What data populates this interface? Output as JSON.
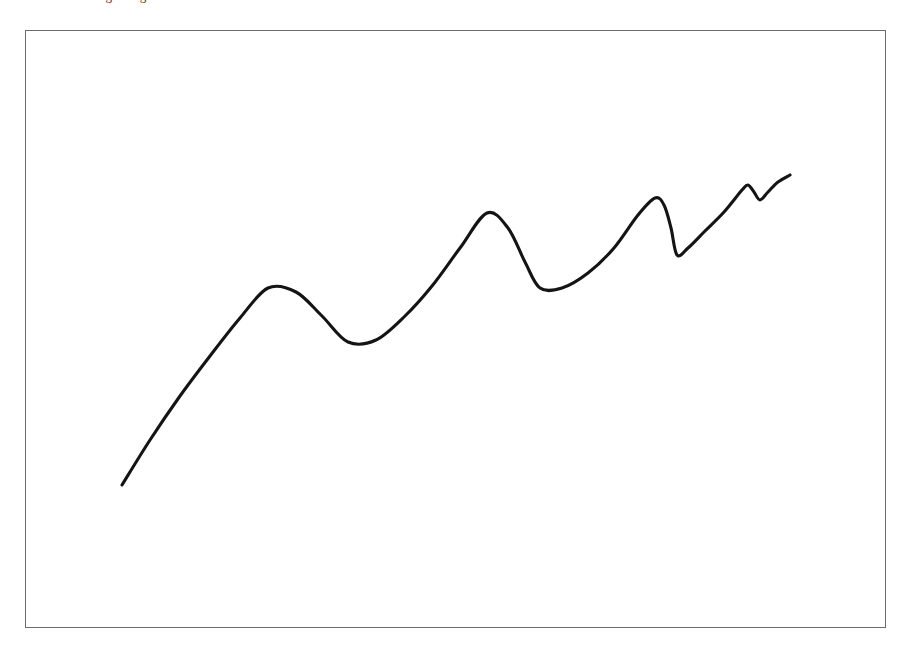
{
  "figure": {
    "caption_clipped": "a curve showing rising trend with oscillations",
    "frame": {
      "x": 25,
      "y": 30,
      "width": 861,
      "height": 598,
      "border_color": "#6b6b6b",
      "background_color": "#ffffff"
    }
  },
  "chart_data": {
    "type": "line",
    "title": "",
    "subtitle": "",
    "xlabel": "",
    "ylabel": "",
    "grid": false,
    "legend": null,
    "axes_visible": false,
    "tick_labels": [],
    "annotations": [],
    "series": [
      {
        "name": "curve",
        "color": "#141414",
        "stroke_width": 3.1,
        "description": "Single smooth hand-drawn style curve rising from lower-left to upper-right with four damped oscillations of decreasing amplitude and increasing frequency",
        "x": [
          122,
          150,
          180,
          210,
          240,
          268,
          296,
          322,
          348,
          376,
          405,
          432,
          460,
          487,
          508,
          525,
          540,
          562,
          588,
          614,
          638,
          655,
          664,
          671,
          677,
          688,
          705,
          724,
          742,
          748,
          754,
          760,
          768,
          778,
          790
        ],
        "y": [
          485,
          440,
          396,
          356,
          318,
          288,
          292,
          316,
          342,
          340,
          316,
          286,
          248,
          213,
          228,
          262,
          288,
          288,
          273,
          248,
          215,
          198,
          205,
          228,
          255,
          248,
          231,
          212,
          190,
          185,
          192,
          200,
          192,
          182,
          175
        ]
      }
    ],
    "xlim": [
      25,
      886
    ],
    "ylim": [
      628,
      30
    ],
    "key_points": {
      "start": [
        122,
        485
      ],
      "peak_1": [
        268,
        288
      ],
      "trough_1": [
        348,
        342
      ],
      "peak_2": [
        487,
        213
      ],
      "trough_2": [
        540,
        288
      ],
      "peak_3": [
        655,
        198
      ],
      "trough_3": [
        677,
        255
      ],
      "peak_4": [
        748,
        185
      ],
      "dip_4": [
        760,
        200
      ],
      "end": [
        790,
        175
      ]
    }
  }
}
